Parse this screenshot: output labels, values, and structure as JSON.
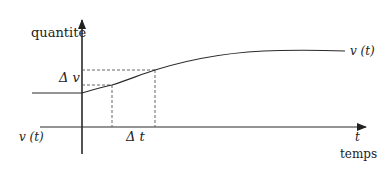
{
  "diagram": {
    "y_axis_label": "quantité",
    "x_axis_symbol": "t",
    "x_axis_label": "temps",
    "curve_label_right": "v (t)",
    "curve_label_left": "v (t)",
    "delta_v_label": "Δ v",
    "delta_t_label": "Δ t",
    "colors": {
      "line": "#2a2a2a",
      "dashed": "#555555",
      "background": "#ffffff"
    }
  }
}
